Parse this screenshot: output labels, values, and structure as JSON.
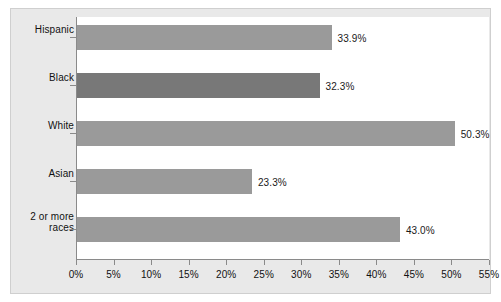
{
  "chart_data": {
    "type": "bar",
    "orientation": "horizontal",
    "title": "",
    "xlabel": "",
    "ylabel": "",
    "categories": [
      "Hispanic",
      "Black",
      "White",
      "Asian",
      "2 or more races"
    ],
    "values": [
      33.9,
      32.3,
      50.3,
      23.3,
      43.0
    ],
    "data_labels": [
      "33.9%",
      "32.3%",
      "50.3%",
      "23.3%",
      "43.0%"
    ],
    "xlim": [
      0,
      55
    ],
    "xticks": [
      0,
      5,
      10,
      15,
      20,
      25,
      30,
      35,
      40,
      45,
      50,
      55
    ],
    "xtick_labels": [
      "0%",
      "5%",
      "10%",
      "15%",
      "20%",
      "25%",
      "30%",
      "35%",
      "40%",
      "45%",
      "50%",
      "55%"
    ],
    "grid": false,
    "legend": null,
    "series": [
      {
        "name": "percent",
        "values": [
          33.9,
          32.3,
          50.3,
          23.3,
          43.0
        ]
      }
    ],
    "bar_colors": [
      "#9a9a9a",
      "#787878",
      "#9a9a9a",
      "#9a9a9a",
      "#9a9a9a"
    ],
    "colors": {
      "figure_background": "#e9e9e9",
      "plot_background": "#ffffff",
      "axis_line": "#8a8a8a",
      "bar_default": "#9a9a9a",
      "bar_highlight": "#787878",
      "label_text": "#111111",
      "frame_border": "#cfcfcf"
    }
  }
}
